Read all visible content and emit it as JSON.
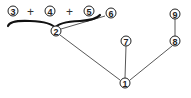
{
  "diagram": {
    "type": "tree",
    "nodes": [
      {
        "id": "3",
        "label": "3",
        "x": 13,
        "y": 12
      },
      {
        "id": "4",
        "label": "4",
        "x": 50,
        "y": 12
      },
      {
        "id": "5",
        "label": "5",
        "x": 89,
        "y": 12
      },
      {
        "id": "6",
        "label": "6",
        "x": 111,
        "y": 13
      },
      {
        "id": "2",
        "label": "2",
        "x": 56,
        "y": 31
      },
      {
        "id": "7",
        "label": "7",
        "x": 126,
        "y": 41
      },
      {
        "id": "9",
        "label": "9",
        "x": 175,
        "y": 14
      },
      {
        "id": "8",
        "label": "8",
        "x": 175,
        "y": 41
      },
      {
        "id": "1",
        "label": "1",
        "x": 125,
        "y": 83
      }
    ],
    "operators": [
      {
        "label": "+",
        "x": 31,
        "y": 16
      },
      {
        "label": "+",
        "x": 70,
        "y": 16
      }
    ],
    "grouping": {
      "type": "brace",
      "covers": [
        "3",
        "4",
        "5"
      ],
      "points_to": "2"
    },
    "edges": [
      {
        "from": "2",
        "to": "6"
      },
      {
        "from": "2",
        "to": "1"
      },
      {
        "from": "7",
        "to": "1"
      },
      {
        "from": "8",
        "to": "1"
      },
      {
        "from": "9",
        "to": "8"
      }
    ]
  }
}
